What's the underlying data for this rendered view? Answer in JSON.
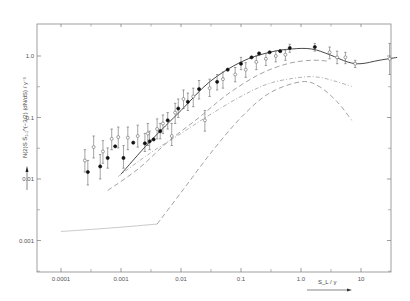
{
  "chart_data": {
    "type": "scatter",
    "title": "",
    "xlabel": "S_L / y",
    "ylabel": "N(2)S S̄₁,₁^(−3/2) (dN/dS) / y⁻¹",
    "xscale": "log",
    "yscale": "log",
    "xlim": [
      6e-05,
      50
    ],
    "ylim": [
      0.0003,
      3
    ],
    "grid": false,
    "legend": null,
    "x_ticks": [
      {
        "value": 0.0001,
        "label": "0.0001"
      },
      {
        "value": 0.001,
        "label": "0.001"
      },
      {
        "value": 0.01,
        "label": "0.01"
      },
      {
        "value": 0.1,
        "label": "0.1"
      },
      {
        "value": 1.0,
        "label": "1.0"
      },
      {
        "value": 10,
        "label": "10"
      }
    ],
    "y_ticks": [
      {
        "value": 1.0,
        "label": "1.0"
      },
      {
        "value": 0.1,
        "label": "0.1"
      },
      {
        "value": 0.01,
        "label": "0.01"
      },
      {
        "value": 0.001,
        "label": "0.001"
      }
    ],
    "series": [
      {
        "name": "filled points",
        "marker": "filled-circle",
        "points": [
          {
            "x": 0.00028,
            "y": 0.013,
            "err": [
              0.008,
              0.02
            ]
          },
          {
            "x": 0.00045,
            "y": 0.016,
            "err": [
              0.01,
              0.025
            ]
          },
          {
            "x": 0.0006,
            "y": 0.022,
            "err": [
              0.015,
              0.032
            ]
          },
          {
            "x": 0.0008,
            "y": 0.034
          },
          {
            "x": 0.0011,
            "y": 0.022,
            "err": [
              0.015,
              0.035
            ]
          },
          {
            "x": 0.0016,
            "y": 0.039
          },
          {
            "x": 0.0025,
            "y": 0.038,
            "err": [
              0.028,
              0.055
            ]
          },
          {
            "x": 0.003,
            "y": 0.041,
            "err": [
              0.03,
              0.06
            ]
          },
          {
            "x": 0.0035,
            "y": 0.044
          },
          {
            "x": 0.0045,
            "y": 0.06,
            "err": [
              0.045,
              0.08
            ]
          },
          {
            "x": 0.006,
            "y": 0.09,
            "err": [
              0.065,
              0.12
            ]
          },
          {
            "x": 0.009,
            "y": 0.14,
            "err": [
              0.1,
              0.2
            ]
          },
          {
            "x": 0.013,
            "y": 0.18,
            "err": [
              0.13,
              0.25
            ]
          },
          {
            "x": 0.02,
            "y": 0.29,
            "err": [
              0.2,
              0.4
            ]
          },
          {
            "x": 0.04,
            "y": 0.38,
            "err": [
              0.28,
              0.5
            ]
          },
          {
            "x": 0.06,
            "y": 0.6
          },
          {
            "x": 0.1,
            "y": 0.75,
            "err": [
              0.6,
              0.95
            ]
          },
          {
            "x": 0.15,
            "y": 0.95
          },
          {
            "x": 0.2,
            "y": 1.1
          },
          {
            "x": 0.3,
            "y": 1.15
          },
          {
            "x": 0.45,
            "y": 1.2
          },
          {
            "x": 0.65,
            "y": 1.35,
            "err": [
              1.15,
              1.55
            ]
          },
          {
            "x": 1.7,
            "y": 1.4,
            "err": [
              1.2,
              1.6
            ]
          }
        ]
      },
      {
        "name": "open points",
        "marker": "open-circle",
        "points": [
          {
            "x": 0.00025,
            "y": 0.02,
            "err": [
              0.013,
              0.03
            ]
          },
          {
            "x": 0.00035,
            "y": 0.033,
            "err": [
              0.022,
              0.05
            ]
          },
          {
            "x": 0.0005,
            "y": 0.028,
            "err": [
              0.018,
              0.042
            ]
          },
          {
            "x": 0.0007,
            "y": 0.045,
            "err": [
              0.03,
              0.065
            ]
          },
          {
            "x": 0.0009,
            "y": 0.048,
            "err": [
              0.032,
              0.07
            ]
          },
          {
            "x": 0.0013,
            "y": 0.047,
            "err": [
              0.03,
              0.07
            ]
          },
          {
            "x": 0.0019,
            "y": 0.05,
            "err": [
              0.033,
              0.075
            ]
          },
          {
            "x": 0.0028,
            "y": 0.055,
            "err": [
              0.035,
              0.08
            ]
          },
          {
            "x": 0.004,
            "y": 0.065,
            "err": [
              0.045,
              0.095
            ]
          },
          {
            "x": 0.005,
            "y": 0.08,
            "err": [
              0.055,
              0.11
            ]
          },
          {
            "x": 0.007,
            "y": 0.05,
            "err": [
              0.035,
              0.08
            ]
          },
          {
            "x": 0.008,
            "y": 0.12,
            "err": [
              0.08,
              0.17
            ]
          },
          {
            "x": 0.011,
            "y": 0.2,
            "err": [
              0.14,
              0.28
            ]
          },
          {
            "x": 0.016,
            "y": 0.22,
            "err": [
              0.15,
              0.3
            ]
          },
          {
            "x": 0.025,
            "y": 0.09,
            "err": [
              0.06,
              0.13
            ]
          },
          {
            "x": 0.03,
            "y": 0.3,
            "err": [
              0.22,
              0.42
            ]
          },
          {
            "x": 0.05,
            "y": 0.42,
            "err": [
              0.3,
              0.55
            ]
          },
          {
            "x": 0.08,
            "y": 0.5,
            "err": [
              0.38,
              0.65
            ]
          },
          {
            "x": 0.12,
            "y": 0.6,
            "err": [
              0.45,
              0.78
            ]
          },
          {
            "x": 0.18,
            "y": 0.8,
            "err": [
              0.6,
              1.0
            ]
          },
          {
            "x": 0.26,
            "y": 0.9,
            "err": [
              0.7,
              1.1
            ]
          },
          {
            "x": 0.38,
            "y": 1.0,
            "err": [
              0.8,
              1.2
            ]
          },
          {
            "x": 0.55,
            "y": 1.05,
            "err": [
              0.85,
              1.25
            ]
          },
          {
            "x": 3.0,
            "y": 1.15,
            "err": [
              0.9,
              1.4
            ]
          },
          {
            "x": 4.0,
            "y": 0.95,
            "err": [
              0.75,
              1.2
            ]
          },
          {
            "x": 5.5,
            "y": 0.95,
            "err": [
              0.75,
              1.15
            ]
          },
          {
            "x": 8.0,
            "y": 0.75,
            "err": [
              0.65,
              0.85
            ]
          },
          {
            "x": 30,
            "y": 0.9,
            "err": [
              0.5,
              1.6
            ]
          }
        ]
      }
    ],
    "curves": [
      {
        "name": "solid total",
        "style": "solid",
        "points": [
          [
            0.001,
            0.012
          ],
          [
            0.003,
            0.04
          ],
          [
            0.01,
            0.13
          ],
          [
            0.03,
            0.38
          ],
          [
            0.1,
            0.8
          ],
          [
            0.3,
            1.15
          ],
          [
            0.7,
            1.3
          ],
          [
            1.5,
            1.3
          ],
          [
            3,
            1.05
          ],
          [
            6,
            0.8
          ],
          [
            10,
            0.75
          ],
          [
            20,
            0.85
          ],
          [
            40,
            0.95
          ]
        ]
      },
      {
        "name": "long dash",
        "style": "dash",
        "points": [
          [
            0.0006,
            0.0065
          ],
          [
            0.002,
            0.015
          ],
          [
            0.006,
            0.04
          ],
          [
            0.02,
            0.1
          ],
          [
            0.06,
            0.24
          ],
          [
            0.2,
            0.5
          ],
          [
            0.6,
            0.75
          ],
          [
            1.5,
            0.85
          ],
          [
            3,
            0.82
          ]
        ]
      },
      {
        "name": "dash-dot",
        "style": "dashdot",
        "points": [
          [
            0.0009,
            0.011
          ],
          [
            0.003,
            0.026
          ],
          [
            0.01,
            0.055
          ],
          [
            0.03,
            0.11
          ],
          [
            0.1,
            0.22
          ],
          [
            0.3,
            0.36
          ],
          [
            1,
            0.45
          ],
          [
            2,
            0.45
          ],
          [
            4,
            0.38
          ],
          [
            7,
            0.32
          ]
        ]
      },
      {
        "name": "dashed lower",
        "style": "dash",
        "points": [
          [
            0.004,
            0.00185
          ],
          [
            0.01,
            0.006
          ],
          [
            0.03,
            0.025
          ],
          [
            0.1,
            0.1
          ],
          [
            0.3,
            0.25
          ],
          [
            1,
            0.38
          ],
          [
            2,
            0.32
          ],
          [
            4,
            0.18
          ],
          [
            7,
            0.09
          ]
        ]
      },
      {
        "name": "faint baseline",
        "style": "faint",
        "points": [
          [
            0.0001,
            0.0014
          ],
          [
            0.0007,
            0.0016
          ],
          [
            0.004,
            0.00185
          ]
        ]
      }
    ]
  }
}
